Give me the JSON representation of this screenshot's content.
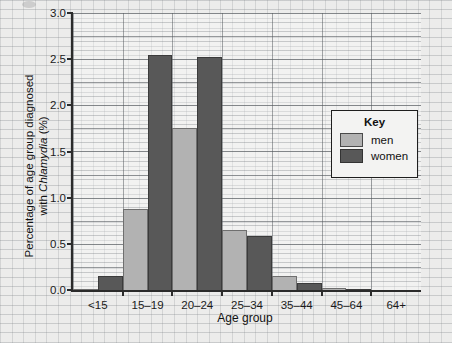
{
  "chart_data": {
    "type": "bar",
    "title": "",
    "xlabel": "Age group",
    "ylabel": "Percentage of age group diagnosed with Chlamydia (%)",
    "ylabel_plain": "Percentage of age group diagnosed",
    "ylabel_italic_line": "with Chlamydia (%)",
    "ylabel_part_a": "with ",
    "ylabel_italic": "Chlamydia",
    "ylabel_part_b": " (%)",
    "categories": [
      "<15",
      "15–19",
      "20–24",
      "25–34",
      "35–44",
      "45–64",
      "64+"
    ],
    "series": [
      {
        "name": "men",
        "color": "#b2b2b2",
        "values": [
          0.01,
          0.88,
          1.76,
          0.65,
          0.15,
          0.02,
          0.0
        ]
      },
      {
        "name": "women",
        "color": "#585858",
        "values": [
          0.15,
          2.55,
          2.52,
          0.59,
          0.08,
          0.01,
          0.0
        ]
      }
    ],
    "ylim": [
      0.0,
      3.0
    ],
    "yticks": [
      "0.0",
      "0.5",
      "1.0",
      "1.5",
      "2.0",
      "2.5",
      "3.0"
    ],
    "ytick_values": [
      0.0,
      0.5,
      1.0,
      1.5,
      2.0,
      2.5,
      3.0
    ],
    "grid": true,
    "grid_style": "graph-paper",
    "legend_position": "inside-right"
  },
  "legend": {
    "title": "Key",
    "entries": [
      {
        "label": "men",
        "color": "#b2b2b2"
      },
      {
        "label": "women",
        "color": "#585858"
      }
    ]
  },
  "colors": {
    "men": "#b2b2b2",
    "women": "#585858",
    "axis": "#2b2b2b",
    "background": "#ececeb"
  }
}
